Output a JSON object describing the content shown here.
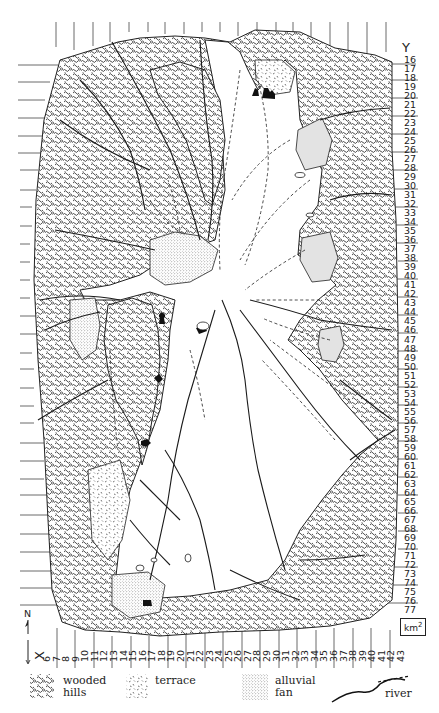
{
  "map": {
    "axes": {
      "y_title": "Y",
      "x_title": "X",
      "y_labels": [
        "16",
        "17",
        "18",
        "19",
        "20",
        "21",
        "22",
        "23",
        "24",
        "25",
        "26",
        "27",
        "28",
        "29",
        "30",
        "31",
        "32",
        "33",
        "34",
        "35",
        "36",
        "37",
        "38",
        "39",
        "40",
        "41",
        "42",
        "43",
        "44",
        "45",
        "46",
        "47",
        "48",
        "49",
        "50",
        "51",
        "52",
        "53",
        "54",
        "55",
        "56",
        "57",
        "58",
        "59",
        "60",
        "61",
        "62",
        "63",
        "64",
        "65",
        "66",
        "67",
        "68",
        "69",
        "70",
        "71",
        "72",
        "73",
        "74",
        "75",
        "76",
        "77"
      ],
      "x_labels": [
        "6",
        "7",
        "8",
        "9",
        "10",
        "11",
        "12",
        "13",
        "14",
        "15",
        "16",
        "17",
        "18",
        "19",
        "20",
        "21",
        "22",
        "23",
        "24",
        "25",
        "26",
        "27",
        "28",
        "29",
        "30",
        "31",
        "32",
        "33",
        "34",
        "35",
        "36",
        "37",
        "38",
        "39",
        "40",
        "41",
        "42",
        "43"
      ]
    },
    "north_label": "N",
    "unit_label": "km",
    "unit_exponent": "2",
    "colors": {
      "ink": "#1a1a1a",
      "paper": "#ffffff",
      "fan_fill": "#d9d9d9"
    }
  },
  "legend": {
    "items": [
      {
        "key": "wooded-hills",
        "label": "wooded\nhills"
      },
      {
        "key": "terrace",
        "label": "terrace"
      },
      {
        "key": "alluvial-fan",
        "label": "alluvial\nfan"
      },
      {
        "key": "river",
        "label": "river"
      }
    ]
  }
}
